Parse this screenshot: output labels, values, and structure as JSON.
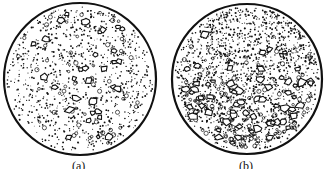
{
  "figure": {
    "panels": [
      {
        "id": "a",
        "label": "(a)",
        "description": "Circular view: uniform dispersion of coarse angular particles in a fine-grained matrix",
        "cx": 80,
        "cy": 79,
        "r": 76,
        "coarse_count": 32,
        "fine_count": 900,
        "coarse_bias": "uniform"
      },
      {
        "id": "b",
        "label": "(b)",
        "description": "Circular view: coarse particles segregated toward the bottom, fine matrix toward the top",
        "cx": 247,
        "cy": 79,
        "r": 75,
        "coarse_count": 70,
        "fine_count": 1600,
        "coarse_bias": "bottom"
      }
    ],
    "colors": {
      "ink": "#111111",
      "background": "#ffffff"
    }
  }
}
